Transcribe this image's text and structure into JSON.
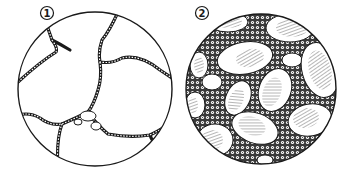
{
  "figure": {
    "panels": [
      {
        "label": "1",
        "description": "Sparse tissue: large empty cells separated by thin cellular septa",
        "center": [
          95,
          89
        ],
        "radius": 77
      },
      {
        "label": "2",
        "description": "Dense tissue: hatched ovoid cells embedded in abundant granular/cellular matrix",
        "center": [
          261,
          89
        ],
        "radius": 75
      }
    ],
    "colors": {
      "ink": "#1a1a1a",
      "background": "#ffffff",
      "matrix": "#555555"
    }
  }
}
